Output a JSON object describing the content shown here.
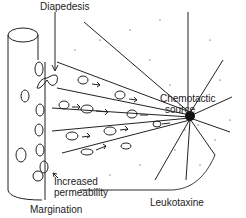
{
  "diagram": {
    "labels": {
      "diapedesis": "Diapedesis",
      "chemotactic_line1": "Chemotactic",
      "chemotactic_line2": "source",
      "increased_line1": "Increased",
      "increased_line2": "permeability",
      "margination": "Margination",
      "leukotaxine": "Leukotaxine"
    },
    "colors": {
      "ink": "#222222",
      "background": "#ffffff"
    }
  }
}
